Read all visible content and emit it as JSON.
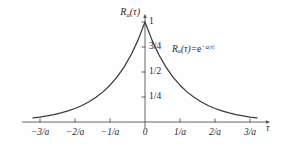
{
  "chart_data": {
    "type": "line",
    "title": "",
    "subtitle": "",
    "xlabel": "τ",
    "ylabel": "R",
    "ylabel_subscript": "a",
    "ylabel_arg": "(τ)",
    "equation": {
      "func": "R",
      "func_subscript": "a",
      "func_arg": "(τ)",
      "equals": "=",
      "base": "e",
      "exponent": "−a|τ|",
      "full": "R_a(τ)=e^{-a|τ|}"
    },
    "xlim": [
      -3.5,
      3.5
    ],
    "ylim": [
      0,
      1.12
    ],
    "xticks": [
      -3,
      -2,
      -1,
      0,
      1,
      2,
      3
    ],
    "xtick_labels": [
      "−3/a",
      "−2/a",
      "−1/a",
      "0",
      "1/a",
      "2/a",
      "3/a"
    ],
    "yticks": [
      0.25,
      0.5,
      0.75,
      1
    ],
    "ytick_labels": [
      "1/4",
      "1/2",
      "3/4",
      "1"
    ],
    "grid": false,
    "legend": "none",
    "axis_arrows": true,
    "series": [
      {
        "name": "R_a(τ)=e^{-a|τ|}",
        "color": "#3a3a3a",
        "x": [
          -3.2,
          -3.0,
          -2.8,
          -2.6,
          -2.4,
          -2.2,
          -2.0,
          -1.8,
          -1.6,
          -1.4,
          -1.2,
          -1.0,
          -0.8,
          -0.6,
          -0.4,
          -0.2,
          0.0,
          0.2,
          0.4,
          0.6,
          0.8,
          1.0,
          1.2,
          1.4,
          1.6,
          1.8,
          2.0,
          2.2,
          2.4,
          2.6,
          2.8,
          3.0,
          3.2
        ],
        "y": [
          0.0408,
          0.0498,
          0.0608,
          0.0743,
          0.0907,
          0.1108,
          0.1353,
          0.1653,
          0.2019,
          0.2466,
          0.3012,
          0.3679,
          0.4493,
          0.5488,
          0.6703,
          0.8187,
          1.0,
          0.8187,
          0.6703,
          0.5488,
          0.4493,
          0.3679,
          0.3012,
          0.2466,
          0.2019,
          0.1653,
          0.1353,
          0.1108,
          0.0907,
          0.0743,
          0.0608,
          0.0498,
          0.0408
        ]
      }
    ],
    "annotations": [
      {
        "name": "peak-value",
        "x": 0,
        "y": 1,
        "text": "1"
      }
    ],
    "colors": {
      "curve": "#3a3a3a",
      "axis": "#555555",
      "text": "#2b2b2b",
      "background": "#fefefe"
    }
  }
}
